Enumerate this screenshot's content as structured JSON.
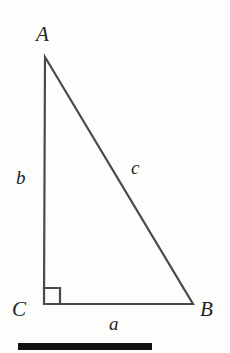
{
  "figure": {
    "background_color": "#fdfdfc",
    "stroke_color": "#4a4a4a",
    "label_color": "#242424",
    "rule_color": "#111111",
    "vertices": {
      "a": {
        "label": "A",
        "x": 45,
        "y": 57
      },
      "b": {
        "label": "B",
        "x": 193,
        "y": 304
      },
      "c": {
        "label": "C",
        "x": 44,
        "y": 304
      }
    },
    "sides": {
      "opposite_a": {
        "label": "a",
        "from": "C",
        "to": "B"
      },
      "opposite_b": {
        "label": "b",
        "from": "A",
        "to": "C"
      },
      "hypotenuse_c": {
        "label": "c",
        "from": "A",
        "to": "B"
      }
    },
    "right_angle": {
      "at": "C",
      "marker": "square",
      "size": 16
    },
    "rule": {
      "label": "bottom-rule",
      "x": 18,
      "y": 343,
      "width": 134,
      "height": 7
    }
  }
}
